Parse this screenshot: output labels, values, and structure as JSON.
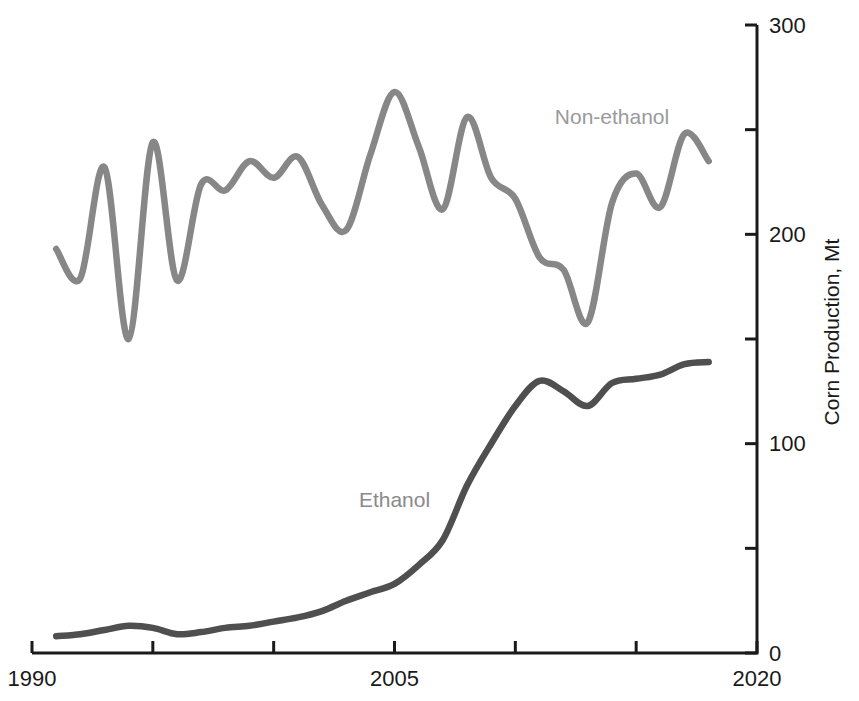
{
  "chart_data": {
    "type": "line",
    "title": "",
    "xlabel": "",
    "ylabel": "Corn Production, Mt",
    "grid": false,
    "legend_position": "inline-labels",
    "background_color": "#ffffff",
    "axis_color": "#1a1a1a",
    "axes": {
      "x": {
        "min": 1990,
        "max": 2020,
        "ticks": [
          1990,
          1995,
          2000,
          2005,
          2010,
          2015,
          2020
        ],
        "tick_labels": [
          "1990",
          "",
          "",
          "2005",
          "",
          "",
          "2020"
        ]
      },
      "y": {
        "min": 0,
        "max": 300,
        "ticks": [
          0,
          50,
          100,
          150,
          200,
          250,
          300
        ],
        "tick_labels": [
          "0",
          "",
          "100",
          "",
          "200",
          "",
          "300"
        ]
      }
    },
    "x_years": [
      1991,
      1992,
      1993,
      1994,
      1995,
      1996,
      1997,
      1998,
      1999,
      2000,
      2001,
      2002,
      2003,
      2004,
      2005,
      2006,
      2007,
      2008,
      2009,
      2010,
      2011,
      2012,
      2013,
      2014,
      2015,
      2016,
      2017,
      2018
    ],
    "series": [
      {
        "name": "Non-ethanol",
        "label": "Non-ethanol",
        "color": "#878787",
        "label_color": "#9a9a9a",
        "label_pos": {
          "year": 2014,
          "value": 256
        },
        "values": [
          193,
          179,
          232,
          150,
          244,
          178,
          224,
          221,
          235,
          227,
          237,
          214,
          202,
          238,
          268,
          242,
          212,
          256,
          227,
          217,
          189,
          183,
          158,
          215,
          229,
          213,
          248,
          235
        ]
      },
      {
        "name": "Ethanol",
        "label": "Ethanol",
        "color": "#4f4f4f",
        "label_color": "#8a8a8a",
        "label_pos": {
          "year": 2005,
          "value": 73
        },
        "values": [
          8,
          9,
          11,
          13,
          12,
          9,
          10,
          12,
          13,
          15,
          17,
          20,
          25,
          29,
          33,
          42,
          54,
          80,
          100,
          118,
          130,
          125,
          118,
          129,
          131,
          133,
          138,
          139
        ]
      }
    ]
  }
}
